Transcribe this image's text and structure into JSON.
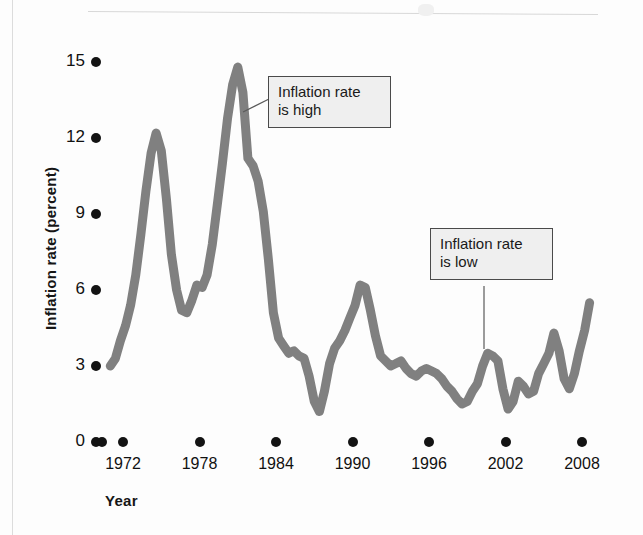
{
  "figure": {
    "y_axis_title": "Inflation rate (percent)",
    "x_axis_title": "Year"
  },
  "annotations": [
    {
      "name": "inflation-high",
      "text": "Inflation rate\nis high"
    },
    {
      "name": "inflation-low",
      "text": "Inflation rate\nis low"
    }
  ],
  "chart_data": {
    "type": "line",
    "title": "",
    "subtitle": "",
    "xlabel": "Year",
    "ylabel": "Inflation rate (percent)",
    "xlim": [
      1971,
      2009
    ],
    "ylim": [
      0,
      15
    ],
    "grid": false,
    "legend": false,
    "legend_position": "none",
    "line_color": "#808080",
    "line_width_px": 9,
    "xticks": [
      1972,
      1978,
      1984,
      1990,
      1996,
      2002,
      2008
    ],
    "xticklabels": [
      "1972",
      "1978",
      "1984",
      "1990",
      "1996",
      "2002",
      "2008"
    ],
    "yticks": [
      0,
      3,
      6,
      9,
      12,
      15
    ],
    "yticklabels": [
      "0",
      "3",
      "6",
      "9",
      "12",
      "15"
    ],
    "annotations": [
      {
        "label": "Inflation rate is high",
        "points_to_x": 1980.4,
        "points_to_y": 13.2
      },
      {
        "label": "Inflation rate is low",
        "points_to_x": 2000.3,
        "points_to_y": 3.4
      }
    ],
    "x": [
      1971.0,
      1971.4,
      1971.8,
      1972.2,
      1972.6,
      1973.0,
      1973.4,
      1973.8,
      1974.2,
      1974.6,
      1975.0,
      1975.4,
      1975.8,
      1976.2,
      1976.6,
      1977.0,
      1977.4,
      1977.8,
      1978.2,
      1978.6,
      1979.0,
      1979.4,
      1979.8,
      1980.2,
      1980.6,
      1981.0,
      1981.4,
      1981.8,
      1982.2,
      1982.6,
      1983.0,
      1983.4,
      1983.8,
      1984.2,
      1984.6,
      1985.0,
      1985.4,
      1985.8,
      1986.2,
      1986.6,
      1987.0,
      1987.4,
      1987.8,
      1988.2,
      1988.6,
      1989.0,
      1989.4,
      1989.8,
      1990.2,
      1990.6,
      1991.0,
      1991.4,
      1991.8,
      1992.2,
      1992.6,
      1993.0,
      1993.4,
      1993.8,
      1994.2,
      1994.6,
      1995.0,
      1995.4,
      1995.8,
      1996.2,
      1996.6,
      1997.0,
      1997.4,
      1997.8,
      1998.2,
      1998.6,
      1999.0,
      1999.4,
      1999.8,
      2000.2,
      2000.6,
      2001.0,
      2001.4,
      2001.8,
      2002.2,
      2002.6,
      2003.0,
      2003.4,
      2003.8,
      2004.2,
      2004.6,
      2005.0,
      2005.4,
      2005.8,
      2006.2,
      2006.6,
      2007.0,
      2007.4,
      2007.8,
      2008.2,
      2008.6
    ],
    "y": [
      3.0,
      3.3,
      4.0,
      4.6,
      5.4,
      6.6,
      8.2,
      9.9,
      11.4,
      12.2,
      11.5,
      9.6,
      7.4,
      6.0,
      5.2,
      5.1,
      5.6,
      6.2,
      6.1,
      6.6,
      7.8,
      9.4,
      11.0,
      12.8,
      14.1,
      14.8,
      13.8,
      11.2,
      10.9,
      10.3,
      9.1,
      7.2,
      5.1,
      4.1,
      3.8,
      3.5,
      3.6,
      3.4,
      3.3,
      2.6,
      1.6,
      1.2,
      2.0,
      3.1,
      3.7,
      4.0,
      4.4,
      4.9,
      5.4,
      6.2,
      6.1,
      5.2,
      4.2,
      3.4,
      3.2,
      3.0,
      3.1,
      3.2,
      2.9,
      2.7,
      2.6,
      2.8,
      2.9,
      2.8,
      2.7,
      2.5,
      2.2,
      2.0,
      1.7,
      1.5,
      1.6,
      2.0,
      2.3,
      3.0,
      3.5,
      3.4,
      3.2,
      2.1,
      1.3,
      1.6,
      2.4,
      2.2,
      1.9,
      2.0,
      2.7,
      3.1,
      3.5,
      4.3,
      3.6,
      2.5,
      2.1,
      2.7,
      3.6,
      4.4,
      5.5
    ]
  }
}
